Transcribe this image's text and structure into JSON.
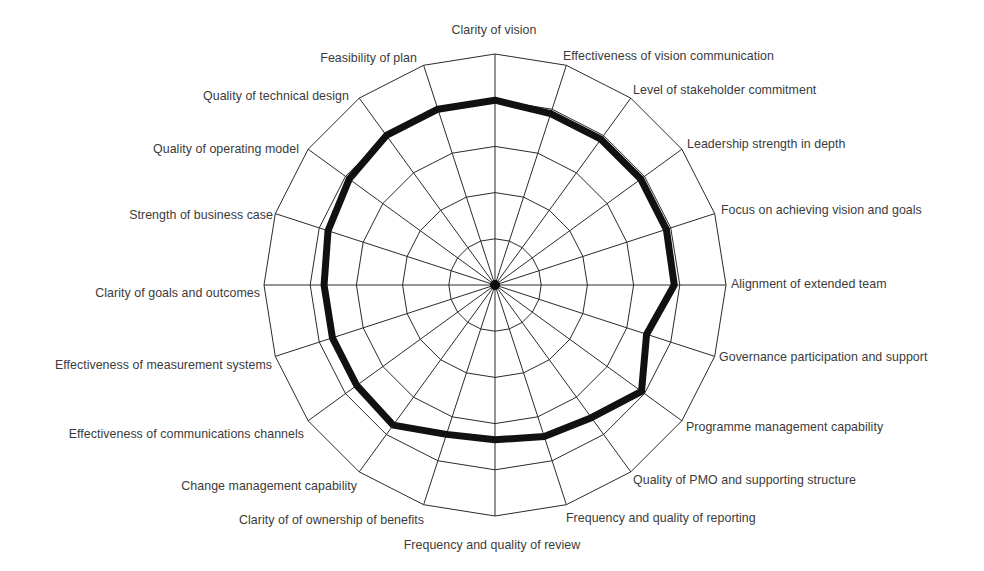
{
  "chart_data": {
    "type": "radar",
    "title": "",
    "subtitle": "",
    "xlabel": "",
    "ylabel": "",
    "grid": true,
    "legend": "none",
    "rings": 5,
    "rlim": [
      0,
      5
    ],
    "ring_shape": "polygon",
    "axis_count": 20,
    "start_angle_deg": -90,
    "direction": "clockwise",
    "line_color": "#111111",
    "grid_color": "#2b2b2b",
    "text_color": "#3b3b3b",
    "background_color": "#ffffff",
    "categories": [
      "Clarity of vision",
      "Effectiveness of vision communication",
      "Level of stakeholder commitment",
      "Leadership strength in depth",
      "Focus on achieving vision and goals",
      "Alignment of extended team",
      "Governance participation and support",
      "Programme management capability",
      "Quality of PMO and supporting structure",
      "Frequency and quality of reporting",
      "Frequency and quality of review",
      "Clarity of of ownership of benefits",
      "Change management capability",
      "Effectiveness of communications channels",
      "Effectiveness of measurement systems",
      "Clarity of goals and outcomes",
      "Strength of business case",
      "Quality of operating model",
      "Quality of technical design",
      "Feasibility of plan"
    ],
    "series": [
      {
        "name": "Assessment",
        "values": [
          4.0,
          3.9,
          3.9,
          3.9,
          3.9,
          3.88,
          3.45,
          3.92,
          3.55,
          3.45,
          3.35,
          3.4,
          3.75,
          3.7,
          3.7,
          3.7,
          3.8,
          3.9,
          4.0,
          4.0
        ]
      }
    ]
  },
  "labels": {
    "items": [
      {
        "text": "Clarity of vision",
        "x": 494,
        "y": 31,
        "anchor": "middle"
      },
      {
        "text": "Effectiveness of vision communication",
        "x": 563,
        "y": 57,
        "anchor": "start"
      },
      {
        "text": "Level of stakeholder commitment",
        "x": 633,
        "y": 91,
        "anchor": "start"
      },
      {
        "text": "Leadership strength in depth",
        "x": 687,
        "y": 145,
        "anchor": "start"
      },
      {
        "text": "Focus on achieving vision and goals",
        "x": 721,
        "y": 211,
        "anchor": "start"
      },
      {
        "text": "Alignment of extended team",
        "x": 731,
        "y": 285,
        "anchor": "start"
      },
      {
        "text": "Governance participation and support",
        "x": 719,
        "y": 358,
        "anchor": "start"
      },
      {
        "text": "Programme management capability",
        "x": 686,
        "y": 428,
        "anchor": "start"
      },
      {
        "text": "Quality of PMO and supporting structure",
        "x": 633,
        "y": 481,
        "anchor": "start"
      },
      {
        "text": "Frequency and quality of reporting",
        "x": 566,
        "y": 519,
        "anchor": "start"
      },
      {
        "text": "Frequency and quality of review",
        "x": 492,
        "y": 546,
        "anchor": "middle"
      },
      {
        "text": "Clarity of of ownership of benefits",
        "x": 424,
        "y": 521,
        "anchor": "end"
      },
      {
        "text": "Change management capability",
        "x": 357,
        "y": 487,
        "anchor": "end"
      },
      {
        "text": "Effectiveness of communications channels",
        "x": 304,
        "y": 435,
        "anchor": "end"
      },
      {
        "text": "Effectiveness of measurement systems",
        "x": 272,
        "y": 366,
        "anchor": "end"
      },
      {
        "text": "Clarity of goals and outcomes",
        "x": 260,
        "y": 294,
        "anchor": "end"
      },
      {
        "text": "Strength of business case",
        "x": 273,
        "y": 216,
        "anchor": "end"
      },
      {
        "text": "Quality of operating model",
        "x": 299,
        "y": 150,
        "anchor": "end"
      },
      {
        "text": "Quality of technical design",
        "x": 349,
        "y": 97,
        "anchor": "end"
      },
      {
        "text": "Feasibility of plan",
        "x": 417,
        "y": 59,
        "anchor": "end"
      }
    ]
  },
  "geometry": {
    "center_x": 495,
    "center_y": 285,
    "outer_radius": 231
  }
}
